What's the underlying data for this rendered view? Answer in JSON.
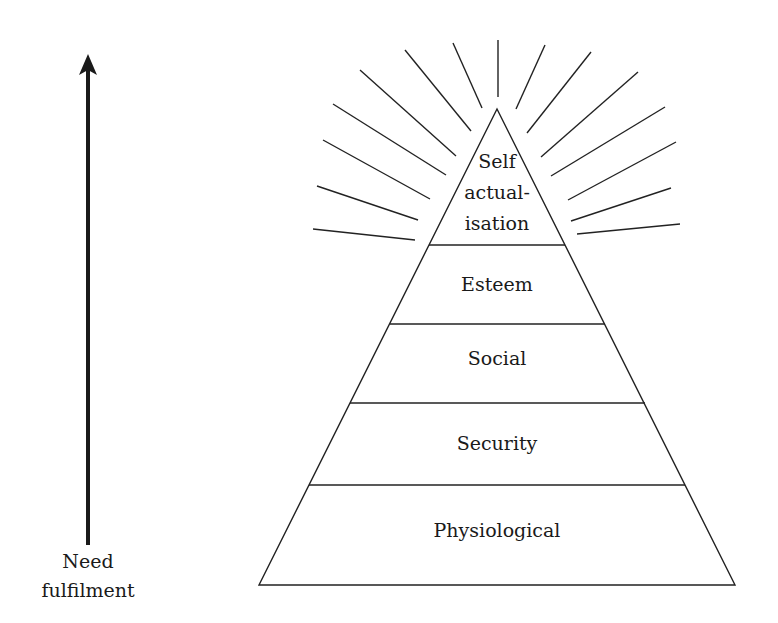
{
  "diagram": {
    "axis_label": {
      "line1": "Need",
      "line2": "fulfilment"
    },
    "levels": [
      {
        "name": "self-actualisation",
        "lines": [
          "Self",
          "actual-",
          "isation"
        ]
      },
      {
        "name": "esteem",
        "lines": [
          "Esteem"
        ]
      },
      {
        "name": "social",
        "lines": [
          "Social"
        ]
      },
      {
        "name": "security",
        "lines": [
          "Security"
        ]
      },
      {
        "name": "physiological",
        "lines": [
          "Physiological"
        ]
      }
    ],
    "colors": {
      "stroke": "#222222",
      "text": "#1a1a1a",
      "background": "#ffffff"
    }
  }
}
